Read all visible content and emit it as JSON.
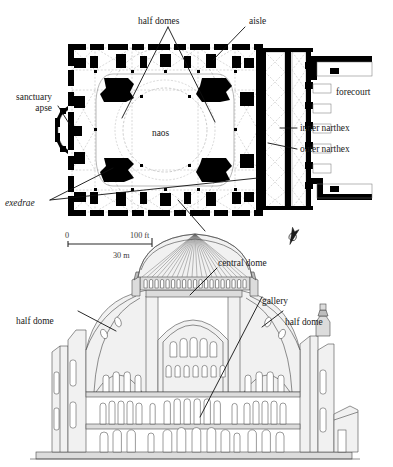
{
  "figure": {
    "ink_color": "#000000",
    "dashed_color": "#b9b9b9",
    "section_line_color": "#444444"
  },
  "plan": {
    "name": "plan-of-hagia-sophia",
    "labels": {
      "half_domes": "half domes",
      "aisle_top": "aisle",
      "aisle_bottom": "aisle",
      "sanctuary_apse_line1": "sanctuary",
      "sanctuary_apse_line2": "apse",
      "naos": "naos",
      "exedrae": "exedrae",
      "forecourt": "forecourt",
      "inner_narthex": "inner narthex",
      "outer_narthex": "outer narthex"
    },
    "compass": {
      "name": "north-arrow",
      "glyph": "north-arrow-icon"
    }
  },
  "scale": {
    "name": "scale-bar",
    "zero": "0",
    "feet": "100 ft",
    "meters": "30 m"
  },
  "section": {
    "name": "longitudinal-section-of-hagia-sophia",
    "labels": {
      "central_dome": "central dome",
      "half_dome_left": "half dome",
      "half_dome_right": "half dome",
      "gallery": "gallery"
    },
    "counts": {
      "dome_windows": 20,
      "dome_ribs": 24,
      "tympanum_upper_windows": 5,
      "tympanum_lower_windows": 7
    }
  }
}
